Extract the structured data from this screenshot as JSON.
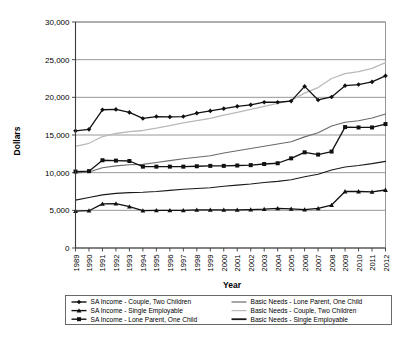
{
  "chart_data": {
    "type": "line",
    "title": "",
    "xlabel": "Year",
    "ylabel": "Dollars",
    "ylim": [
      0,
      30000
    ],
    "ytick_labels": [
      "0",
      "5,000",
      "10,000",
      "15,000",
      "20,000",
      "25,000",
      "30,000"
    ],
    "ytick_values": [
      0,
      5000,
      10000,
      15000,
      20000,
      25000,
      30000
    ],
    "grid": true,
    "legend_position": "bottom",
    "x": [
      1989,
      1990,
      1991,
      1992,
      1993,
      1994,
      1995,
      1996,
      1997,
      1998,
      1999,
      2000,
      2001,
      2002,
      2003,
      2004,
      2005,
      2006,
      2007,
      2008,
      2009,
      2010,
      2011,
      2012
    ],
    "xtick_labels": [
      "1989",
      "1990",
      "1991",
      "1992",
      "1993",
      "1994",
      "1995",
      "1996",
      "1997",
      "1998",
      "1999",
      "2000",
      "2001",
      "2002",
      "2003",
      "2004",
      "2005",
      "2006",
      "2007",
      "2008",
      "2009",
      "2010",
      "2011",
      "2012"
    ],
    "series": [
      {
        "name": "SA Income - Couple, Two Children",
        "marker": "plus-diamond",
        "color": "#111111",
        "width": 1.3,
        "values": [
          15550,
          15750,
          18350,
          18400,
          18000,
          17200,
          17450,
          17400,
          17450,
          17900,
          18200,
          18500,
          18800,
          19000,
          19350,
          19350,
          19500,
          21450,
          19650,
          20050,
          21550,
          21700,
          22050,
          22850
        ]
      },
      {
        "name": "SA Income - Single Employable",
        "marker": "triangle",
        "color": "#111111",
        "width": 1.3,
        "values": [
          4900,
          4950,
          5850,
          5900,
          5500,
          4950,
          5000,
          5000,
          5000,
          5050,
          5050,
          5050,
          5050,
          5100,
          5150,
          5250,
          5200,
          5100,
          5250,
          5700,
          7500,
          7500,
          7450,
          7700
        ]
      },
      {
        "name": "SA Income - Lone Parent, One Child",
        "marker": "square",
        "color": "#111111",
        "width": 1.3,
        "values": [
          10150,
          10200,
          11650,
          11600,
          11550,
          10800,
          10800,
          10800,
          10800,
          10850,
          10900,
          10900,
          10950,
          11000,
          11150,
          11250,
          11900,
          12700,
          12400,
          12800,
          16050,
          16000,
          16000,
          16450
        ]
      },
      {
        "name": "Basic Needs - Lone Parent, One Child",
        "marker": "none",
        "color": "#6a6a6a",
        "width": 1.1,
        "values": [
          9950,
          10100,
          10650,
          10900,
          11050,
          11100,
          11350,
          11600,
          11850,
          12050,
          12250,
          12600,
          12900,
          13200,
          13500,
          13800,
          14100,
          14750,
          15300,
          16200,
          16700,
          16900,
          17250,
          17800
        ]
      },
      {
        "name": "Basic Needs - Couple, Two Children",
        "marker": "none",
        "color": "#b9b9b9",
        "width": 1.3,
        "values": [
          13500,
          13900,
          14800,
          15200,
          15450,
          15600,
          15900,
          16250,
          16600,
          16900,
          17200,
          17650,
          18000,
          18400,
          18800,
          19200,
          19600,
          20550,
          21300,
          22500,
          23150,
          23400,
          23850,
          24600
        ]
      },
      {
        "name": "Basic Needs - Single Employable",
        "marker": "none",
        "color": "#1a1a1a",
        "width": 1.1,
        "values": [
          6350,
          6700,
          7050,
          7250,
          7350,
          7400,
          7500,
          7650,
          7800,
          7900,
          8000,
          8200,
          8350,
          8500,
          8700,
          8850,
          9050,
          9450,
          9800,
          10350,
          10750,
          10950,
          11200,
          11500
        ]
      }
    ]
  },
  "legend": {
    "entries": [
      {
        "label": "SA Income - Couple, Two Children",
        "series_index": 0
      },
      {
        "label": "SA Income - Single Employable",
        "series_index": 1
      },
      {
        "label": "SA Income - Lone Parent, One Child",
        "series_index": 2
      },
      {
        "label": "Basic Needs - Lone Parent, One Child",
        "series_index": 3
      },
      {
        "label": "Basic Needs - Couple, Two Children",
        "series_index": 4
      },
      {
        "label": "Basic Needs - Single Employable",
        "series_index": 5
      }
    ]
  }
}
